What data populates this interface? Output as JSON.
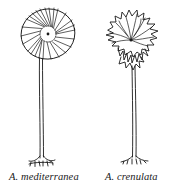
{
  "figure": {
    "specimens": [
      {
        "id": "left",
        "label": "A. mediterranea",
        "cap_shape": "smooth radiate disc",
        "ink_color": "#1a1a1a"
      },
      {
        "id": "right",
        "label": "A. crenulata",
        "cap_shape": "ragged crenulate whorl",
        "ink_color": "#1a1a1a"
      }
    ],
    "background": "#ffffff"
  }
}
